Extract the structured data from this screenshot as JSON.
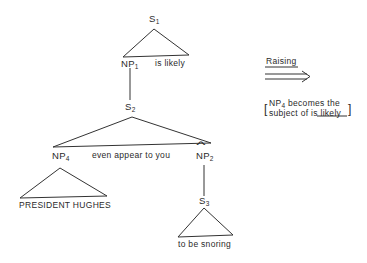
{
  "tree": {
    "s1": {
      "label": "S",
      "sub": "1"
    },
    "np1": {
      "label": "NP",
      "sub": "1"
    },
    "is_likely": "is likely",
    "s2": {
      "label": "S",
      "sub": "2"
    },
    "np4": {
      "label": "NP",
      "sub": "4"
    },
    "even_appear": "even appear to you",
    "np2": {
      "label": "NP",
      "sub": "2",
      "hat": "^"
    },
    "president": "PRESIDENT HUGHES",
    "s3": {
      "label": "S",
      "sub": "3"
    },
    "to_be_snoring": "to be snoring"
  },
  "annotation": {
    "rule": "Raising",
    "arrow": "double-right-arrow",
    "note_line1_prefix": "NP",
    "note_line1_sub": "4",
    "note_line1_rest": " becomes the",
    "note_line2_prefix": "subject of ",
    "note_line2_underlined": "is likely",
    "bracket_open": "[",
    "bracket_close": "]"
  },
  "colors": {
    "line": "#333333",
    "text": "#2a2a2a",
    "background": "#ffffff"
  }
}
